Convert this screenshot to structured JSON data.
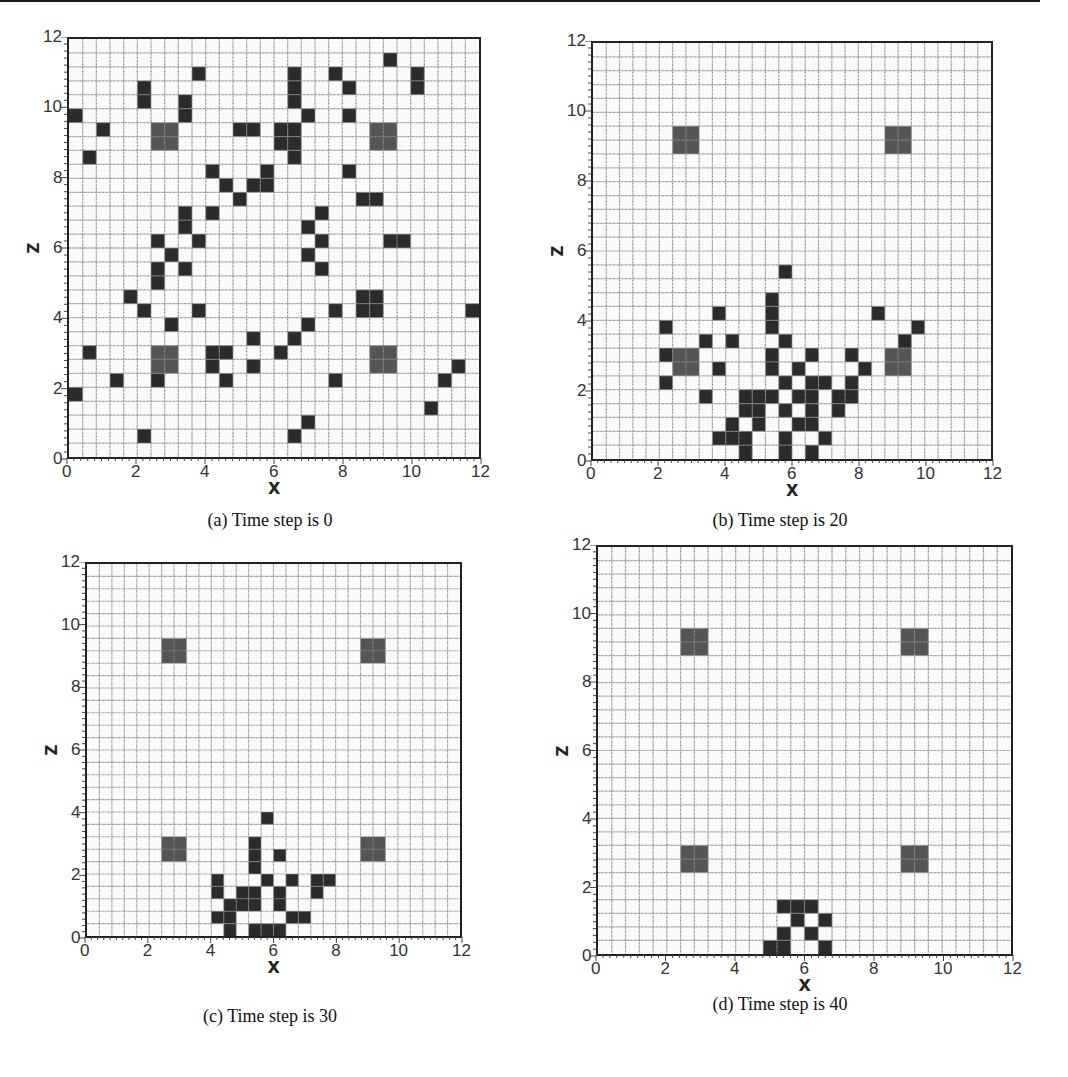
{
  "chart_data": [
    {
      "type": "heatmap",
      "id": "a",
      "title": "(a) Time step is 0",
      "xlabel": "X",
      "ylabel": "Z",
      "xlim": [
        0,
        12
      ],
      "ylim": [
        0,
        12
      ],
      "xticks": [
        "0",
        "2",
        "4",
        "6",
        "8",
        "10",
        "12"
      ],
      "yticks": [
        "0",
        "2",
        "4",
        "6",
        "8",
        "10",
        "12"
      ],
      "grid": {
        "cols": 30,
        "rows": 30,
        "cell_size": 0.4
      },
      "obstacles_gray": [
        [
          6,
          6
        ],
        [
          22,
          6
        ],
        [
          6,
          22
        ],
        [
          22,
          22
        ]
      ],
      "dark_cells": [
        [
          9,
          2
        ],
        [
          5,
          3
        ],
        [
          5,
          4
        ],
        [
          8,
          4
        ],
        [
          8,
          5
        ],
        [
          0,
          5
        ],
        [
          2,
          6
        ],
        [
          12,
          6
        ],
        [
          13,
          6
        ],
        [
          1,
          8
        ],
        [
          10,
          9
        ],
        [
          14,
          9
        ],
        [
          11,
          10
        ],
        [
          13,
          10
        ],
        [
          14,
          10
        ],
        [
          12,
          11
        ],
        [
          8,
          12
        ],
        [
          8,
          13
        ],
        [
          10,
          12
        ],
        [
          6,
          14
        ],
        [
          9,
          14
        ],
        [
          23,
          1
        ],
        [
          16,
          2
        ],
        [
          16,
          3
        ],
        [
          16,
          4
        ],
        [
          19,
          2
        ],
        [
          25,
          2
        ],
        [
          25,
          3
        ],
        [
          20,
          3
        ],
        [
          17,
          5
        ],
        [
          20,
          5
        ],
        [
          15,
          6
        ],
        [
          16,
          6
        ],
        [
          15,
          7
        ],
        [
          16,
          7
        ],
        [
          16,
          8
        ],
        [
          20,
          9
        ],
        [
          21,
          11
        ],
        [
          22,
          11
        ],
        [
          18,
          12
        ],
        [
          17,
          13
        ],
        [
          18,
          14
        ],
        [
          23,
          14
        ],
        [
          24,
          14
        ],
        [
          7,
          15
        ],
        [
          6,
          16
        ],
        [
          6,
          17
        ],
        [
          8,
          16
        ],
        [
          4,
          18
        ],
        [
          5,
          19
        ],
        [
          9,
          19
        ],
        [
          7,
          20
        ],
        [
          13,
          21
        ],
        [
          1,
          22
        ],
        [
          10,
          22
        ],
        [
          11,
          22
        ],
        [
          10,
          23
        ],
        [
          13,
          23
        ],
        [
          3,
          24
        ],
        [
          6,
          24
        ],
        [
          11,
          24
        ],
        [
          0,
          25
        ],
        [
          5,
          28
        ],
        [
          17,
          15
        ],
        [
          18,
          16
        ],
        [
          21,
          18
        ],
        [
          22,
          18
        ],
        [
          21,
          19
        ],
        [
          22,
          19
        ],
        [
          19,
          19
        ],
        [
          29,
          19
        ],
        [
          17,
          20
        ],
        [
          16,
          21
        ],
        [
          15,
          22
        ],
        [
          28,
          23
        ],
        [
          19,
          24
        ],
        [
          27,
          24
        ],
        [
          26,
          26
        ],
        [
          17,
          27
        ],
        [
          16,
          28
        ]
      ]
    },
    {
      "type": "heatmap",
      "id": "b",
      "title": "(b) Time step is 20",
      "xlabel": "X",
      "ylabel": "Z",
      "xlim": [
        0,
        12
      ],
      "ylim": [
        0,
        12
      ],
      "xticks": [
        "0",
        "2",
        "4",
        "6",
        "8",
        "10",
        "12"
      ],
      "yticks": [
        "0",
        "2",
        "4",
        "6",
        "8",
        "10",
        "12"
      ],
      "grid": {
        "cols": 30,
        "rows": 30,
        "cell_size": 0.4
      },
      "obstacles_gray": [
        [
          6,
          6
        ],
        [
          22,
          6
        ],
        [
          6,
          22
        ],
        [
          22,
          22
        ]
      ],
      "dark_cells": [
        [
          14,
          16
        ],
        [
          13,
          18
        ],
        [
          13,
          19
        ],
        [
          13,
          20
        ],
        [
          9,
          19
        ],
        [
          21,
          19
        ],
        [
          5,
          20
        ],
        [
          24,
          20
        ],
        [
          8,
          21
        ],
        [
          10,
          21
        ],
        [
          14,
          21
        ],
        [
          23,
          21
        ],
        [
          5,
          22
        ],
        [
          13,
          22
        ],
        [
          16,
          22
        ],
        [
          19,
          22
        ],
        [
          9,
          23
        ],
        [
          13,
          23
        ],
        [
          15,
          23
        ],
        [
          20,
          23
        ],
        [
          5,
          24
        ],
        [
          14,
          24
        ],
        [
          16,
          24
        ],
        [
          17,
          24
        ],
        [
          19,
          24
        ],
        [
          8,
          25
        ],
        [
          11,
          25
        ],
        [
          12,
          25
        ],
        [
          13,
          25
        ],
        [
          15,
          25
        ],
        [
          16,
          25
        ],
        [
          18,
          25
        ],
        [
          19,
          25
        ],
        [
          11,
          26
        ],
        [
          12,
          26
        ],
        [
          14,
          26
        ],
        [
          16,
          26
        ],
        [
          18,
          26
        ],
        [
          10,
          27
        ],
        [
          12,
          27
        ],
        [
          15,
          27
        ],
        [
          16,
          27
        ],
        [
          9,
          28
        ],
        [
          10,
          28
        ],
        [
          11,
          28
        ],
        [
          14,
          28
        ],
        [
          17,
          28
        ],
        [
          11,
          29
        ],
        [
          14,
          29
        ],
        [
          16,
          29
        ]
      ]
    },
    {
      "type": "heatmap",
      "id": "c",
      "title": "(c) Time step is 30",
      "xlabel": "X",
      "ylabel": "Z",
      "xlim": [
        0,
        12
      ],
      "ylim": [
        0,
        12
      ],
      "xticks": [
        "0",
        "2",
        "4",
        "6",
        "8",
        "10",
        "12"
      ],
      "yticks": [
        "0",
        "2",
        "4",
        "6",
        "8",
        "10",
        "12"
      ],
      "grid": {
        "cols": 30,
        "rows": 30,
        "cell_size": 0.4
      },
      "obstacles_gray": [
        [
          6,
          6
        ],
        [
          22,
          6
        ],
        [
          6,
          22
        ],
        [
          22,
          22
        ]
      ],
      "dark_cells": [
        [
          14,
          20
        ],
        [
          13,
          22
        ],
        [
          13,
          23
        ],
        [
          13,
          24
        ],
        [
          15,
          23
        ],
        [
          10,
          25
        ],
        [
          14,
          25
        ],
        [
          16,
          25
        ],
        [
          18,
          25
        ],
        [
          19,
          25
        ],
        [
          10,
          26
        ],
        [
          12,
          26
        ],
        [
          13,
          26
        ],
        [
          15,
          26
        ],
        [
          18,
          26
        ],
        [
          11,
          27
        ],
        [
          12,
          27
        ],
        [
          13,
          27
        ],
        [
          15,
          27
        ],
        [
          10,
          28
        ],
        [
          11,
          28
        ],
        [
          16,
          28
        ],
        [
          17,
          28
        ],
        [
          11,
          29
        ],
        [
          13,
          29
        ],
        [
          14,
          29
        ],
        [
          15,
          29
        ]
      ]
    },
    {
      "type": "heatmap",
      "id": "d",
      "title": "(d) Time step is 40",
      "xlabel": "X",
      "ylabel": "Z",
      "xlim": [
        0,
        12
      ],
      "ylim": [
        0,
        12
      ],
      "xticks": [
        "0",
        "2",
        "4",
        "6",
        "8",
        "10",
        "12"
      ],
      "yticks": [
        "0",
        "2",
        "4",
        "6",
        "8",
        "10",
        "12"
      ],
      "grid": {
        "cols": 30,
        "rows": 30,
        "cell_size": 0.4
      },
      "obstacles_gray": [
        [
          6,
          6
        ],
        [
          22,
          6
        ],
        [
          6,
          22
        ],
        [
          22,
          22
        ]
      ],
      "dark_cells": [
        [
          13,
          26
        ],
        [
          14,
          26
        ],
        [
          15,
          26
        ],
        [
          14,
          27
        ],
        [
          16,
          27
        ],
        [
          13,
          28
        ],
        [
          15,
          28
        ],
        [
          12,
          29
        ],
        [
          13,
          29
        ],
        [
          16,
          29
        ]
      ]
    }
  ],
  "colors": {
    "grid_line": "#8a8a8a",
    "background": "#fafafa",
    "dark_cell": "#2b2b2b",
    "obstacle": "#555555",
    "axis": "#222222"
  },
  "panels": [
    {
      "caption": "(a) Time step is 0",
      "xlabel": "X",
      "ylabel": "Z"
    },
    {
      "caption": "(b) Time step is 20",
      "xlabel": "X",
      "ylabel": "Z"
    },
    {
      "caption": "(c) Time step is 30",
      "xlabel": "X",
      "ylabel": "Z"
    },
    {
      "caption": "(d) Time step is 40",
      "xlabel": "X",
      "ylabel": "Z"
    }
  ]
}
